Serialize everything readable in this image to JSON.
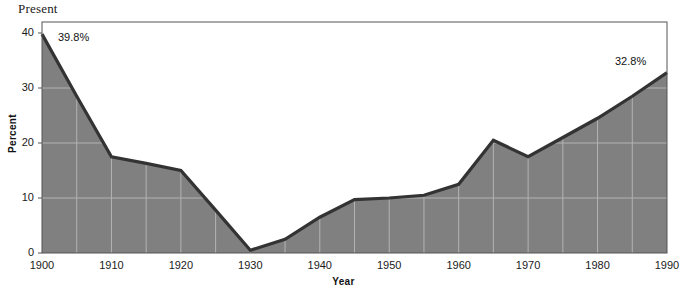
{
  "chart_data": {
    "type": "area",
    "title": "Present",
    "xlabel": "Year",
    "ylabel": "Percent",
    "xlim": [
      1900,
      1990
    ],
    "ylim": [
      0,
      42
    ],
    "grid": true,
    "legend": "none",
    "x_ticks": [
      "1900",
      "1910",
      "1920",
      "1930",
      "1940",
      "1950",
      "1960",
      "1970",
      "1980",
      "1990"
    ],
    "y_ticks": [
      "0",
      "10",
      "20",
      "30",
      "40"
    ],
    "x_gridline_step": 5,
    "y_gridline_step": 10,
    "series": [
      {
        "name": "Percent",
        "x": [
          1900,
          1905,
          1910,
          1915,
          1920,
          1925,
          1930,
          1935,
          1940,
          1945,
          1950,
          1955,
          1960,
          1965,
          1970,
          1975,
          1980,
          1985,
          1990
        ],
        "values": [
          39.8,
          28.5,
          17.5,
          16.3,
          15.0,
          7.8,
          0.5,
          2.5,
          6.5,
          9.7,
          10.0,
          10.5,
          12.5,
          20.5,
          17.5,
          21.0,
          24.5,
          28.5,
          32.8
        ]
      }
    ],
    "annotations": [
      {
        "text": "39.8%",
        "x": 1900,
        "y": 39.8
      },
      {
        "text": "32.8%",
        "x": 1990,
        "y": 32.8
      }
    ],
    "colors": {
      "area_fill": "#808080",
      "line": "#333333",
      "gridline": "#b3b3b3",
      "frame": "#555555",
      "text": "#1a1a1a",
      "background": "#ffffff"
    }
  }
}
